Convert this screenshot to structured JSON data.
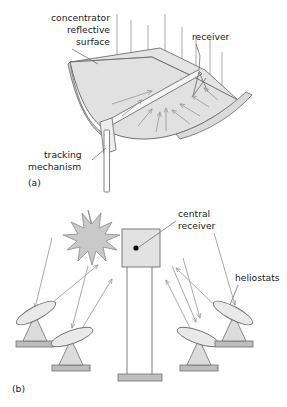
{
  "figure": {
    "title_visible": false,
    "background_color": "#ffffff",
    "line_color": "#6f6f6f",
    "ray_color": "#9a9a9a",
    "fill_light": "#e8e8e8",
    "fill_mid": "#d8d8d8",
    "fill_dark": "#b9b9b9",
    "text_color": "#1a1a1a"
  },
  "panel_a": {
    "tag": "(a)",
    "labels": {
      "concentrator": "concentrator",
      "reflective": "reflective",
      "surface": "surface",
      "receiver": "receiver",
      "tracking": "tracking",
      "mechanism": "mechanism"
    },
    "components": [
      "parabolic-trough-reflector",
      "receiver-tube",
      "receiver-support-struts",
      "tracking-post",
      "incoming-sun-rays",
      "reflected-rays"
    ],
    "incoming_ray_count": 8,
    "reflected_ray_count": 9
  },
  "panel_b": {
    "tag": "(b)",
    "labels": {
      "central": "central",
      "receiver": "receiver",
      "heliostats": "heliostats"
    },
    "components": [
      "sun-starburst",
      "tower",
      "central-receiver-box",
      "receiver-aperture-dot",
      "tower-base",
      "heliostat-mirrors",
      "heliostat-pedestals",
      "heliostat-ground-pads",
      "incident-rays",
      "reflected-rays"
    ],
    "sun_points": 12,
    "heliostat_count": 4,
    "heliostats": [
      {
        "id": "heliostat-left-far",
        "tilt_deg": -28
      },
      {
        "id": "heliostat-left-near",
        "tilt_deg": -20
      },
      {
        "id": "heliostat-right-near",
        "tilt_deg": 20
      },
      {
        "id": "heliostat-right-far",
        "tilt_deg": 28
      }
    ]
  }
}
